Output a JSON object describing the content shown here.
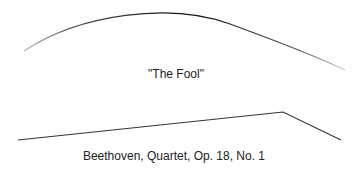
{
  "diagram": {
    "type": "melodic-contour-comparison",
    "contours": [
      {
        "id": "fool",
        "shape": "arch",
        "label": "\"The Fool\"",
        "path": [
          [
            24,
            51
          ],
          [
            150,
            14
          ],
          [
            345,
            70
          ]
        ],
        "stroke": "#333333"
      },
      {
        "id": "beethoven",
        "shape": "ramp-then-drop",
        "label": "Beethoven, Quartet, Op. 18, No. 1",
        "points": [
          [
            18,
            140
          ],
          [
            283,
            112
          ],
          [
            341,
            140
          ]
        ],
        "stroke": "#333333"
      }
    ]
  }
}
